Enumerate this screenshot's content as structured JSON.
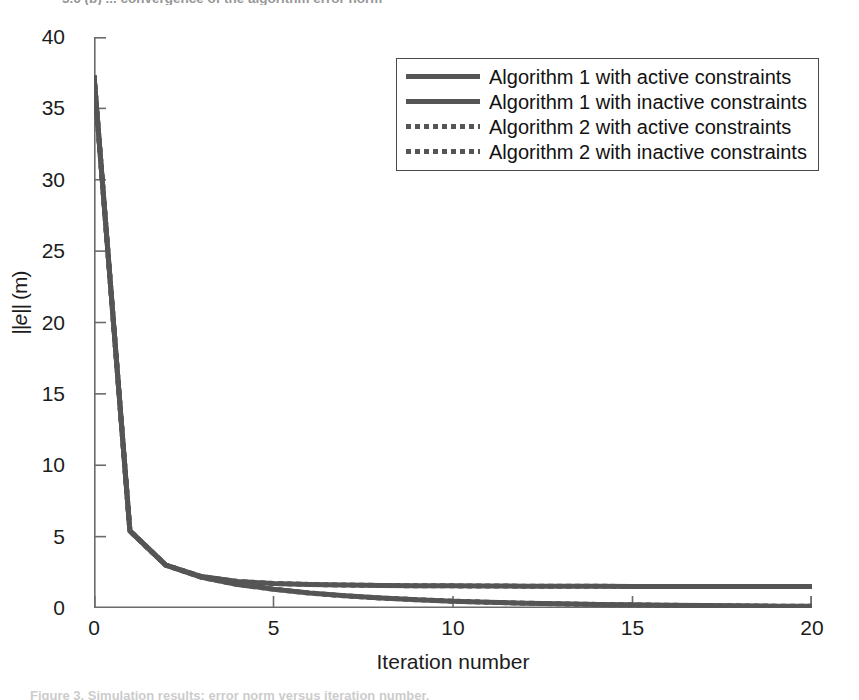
{
  "figure": {
    "caption_top": "3.6 (b) ... convergence of the algorithm error norm",
    "caption_bottom": "Figure 3. Simulation results: error norm versus iteration number."
  },
  "chart_data": {
    "type": "line",
    "title": "",
    "xlabel": "Iteration number",
    "ylabel": "||e|| (m)",
    "xlim": [
      0,
      20
    ],
    "ylim": [
      0,
      40
    ],
    "xticks": [
      0,
      5,
      10,
      15,
      20
    ],
    "yticks": [
      0,
      5,
      10,
      15,
      20,
      25,
      30,
      35,
      40
    ],
    "grid": false,
    "legend_position": "top-right",
    "line_color": "#555555",
    "axis_color": "#6b6b6b",
    "series": [
      {
        "name": "Algorithm 1 with active constraints",
        "style": "solid",
        "color": "#555555",
        "x": [
          0,
          1,
          2,
          3,
          4,
          5,
          6,
          7,
          8,
          9,
          10,
          11,
          12,
          13,
          14,
          15,
          16,
          17,
          18,
          19,
          20
        ],
        "values": [
          37.3,
          5.4,
          3.0,
          2.2,
          1.85,
          1.72,
          1.65,
          1.61,
          1.58,
          1.56,
          1.55,
          1.54,
          1.53,
          1.52,
          1.52,
          1.51,
          1.51,
          1.5,
          1.5,
          1.5,
          1.5
        ]
      },
      {
        "name": "Algorithm 1 with inactive constraints",
        "style": "solid",
        "color": "#555555",
        "x": [
          0,
          1,
          2,
          3,
          4,
          5,
          6,
          7,
          8,
          9,
          10,
          11,
          12,
          13,
          14,
          15,
          16,
          17,
          18,
          19,
          20
        ],
        "values": [
          37.3,
          5.4,
          3.0,
          2.15,
          1.65,
          1.32,
          1.05,
          0.85,
          0.7,
          0.58,
          0.48,
          0.4,
          0.34,
          0.29,
          0.25,
          0.22,
          0.19,
          0.17,
          0.15,
          0.13,
          0.12
        ]
      },
      {
        "name": "Algorithm 2 with active constraints",
        "style": "dotted",
        "color": "#555555",
        "x": [
          0,
          1,
          2,
          3,
          4,
          5,
          6,
          7,
          8,
          9,
          10,
          11,
          12,
          13,
          14,
          15,
          16,
          17,
          18,
          19,
          20
        ],
        "values": [
          37.3,
          5.4,
          3.0,
          2.2,
          1.85,
          1.72,
          1.65,
          1.61,
          1.58,
          1.56,
          1.55,
          1.54,
          1.53,
          1.52,
          1.52,
          1.51,
          1.51,
          1.5,
          1.5,
          1.5,
          1.5
        ]
      },
      {
        "name": "Algorithm 2 with inactive constraints",
        "style": "dotted",
        "color": "#555555",
        "x": [
          0,
          1,
          2,
          3,
          4,
          5,
          6,
          7,
          8,
          9,
          10,
          11,
          12,
          13,
          14,
          15,
          16,
          17,
          18,
          19,
          20
        ],
        "values": [
          37.3,
          5.4,
          3.0,
          2.15,
          1.65,
          1.32,
          1.05,
          0.85,
          0.7,
          0.58,
          0.48,
          0.4,
          0.34,
          0.29,
          0.25,
          0.22,
          0.19,
          0.17,
          0.15,
          0.13,
          0.12
        ]
      }
    ]
  },
  "axes": {
    "x_title": "Iteration number",
    "y_title_prefix": "||",
    "y_title_var": "e",
    "y_title_suffix": "|| (m)",
    "x_tick_labels": [
      "0",
      "5",
      "10",
      "15",
      "20"
    ],
    "y_tick_labels": [
      "0",
      "5",
      "10",
      "15",
      "20",
      "25",
      "30",
      "35",
      "40"
    ]
  },
  "legend": {
    "entries": [
      {
        "label": "Algorithm 1 with active constraints",
        "style": "solid"
      },
      {
        "label": "Algorithm 1 with inactive constraints",
        "style": "solid"
      },
      {
        "label": "Algorithm 2 with active constraints",
        "style": "dotted"
      },
      {
        "label": "Algorithm 2 with inactive constraints",
        "style": "dotted"
      }
    ]
  }
}
